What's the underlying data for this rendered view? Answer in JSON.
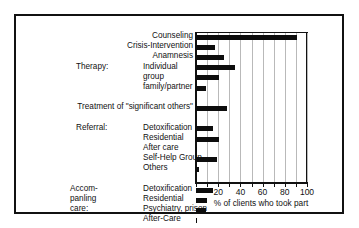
{
  "figure": {
    "frame_border_color": "#111111",
    "background": "#ffffff",
    "bar_color": "#0d0d0d",
    "grid_color": "#b9b9b9"
  },
  "chart_data": {
    "type": "bar",
    "orientation": "horizontal",
    "title": "",
    "xlabel": "% of clients who took part",
    "ylabel": "",
    "xlim": [
      0,
      100
    ],
    "grid": true,
    "legend": "none",
    "xticks": [
      0,
      10,
      20,
      30,
      40,
      50,
      60,
      70,
      80,
      90,
      100
    ],
    "xticklabels": [
      "",
      "",
      "20",
      "",
      "40",
      "",
      "60",
      "",
      "80",
      "",
      "100"
    ],
    "xticklabels_shown": [
      "20",
      "40",
      "60",
      "80",
      "100"
    ],
    "categories": [
      "Counseling",
      "Crisis-Intervention",
      "Anamnesis",
      "Therapy: Individual",
      "Therapy: group",
      "Therapy: family/partner",
      "Treatment of \"significant others\"",
      "Referral: Detoxification",
      "Referral: Residential",
      "Referral: After care",
      "Referral: Self-Help Group",
      "Referral: Others",
      "Accompanying care: Detoxification",
      "Accompanying care: Residential",
      "Accompanying care: Psychiatry, prison",
      "Accompanying care: After-Care"
    ],
    "values": [
      91,
      17,
      25,
      35,
      21,
      9,
      28,
      15,
      21,
      1,
      19,
      3,
      15,
      10,
      9,
      1
    ]
  },
  "label_rows": [
    {
      "id": "counseling",
      "text": "Counseling",
      "style": "right"
    },
    {
      "id": "crisis-intervention",
      "text": "Crisis-Intervention",
      "style": "right"
    },
    {
      "id": "anamnesis",
      "text": "Anamnesis",
      "style": "right"
    },
    {
      "id": "therapy-individual",
      "group": "Therapy:",
      "text": "Individual",
      "style": "group"
    },
    {
      "id": "therapy-group",
      "text": "group",
      "style": "sub"
    },
    {
      "id": "therapy-family",
      "text": "family/partner",
      "style": "sub"
    },
    {
      "id": "treatment-significant-others",
      "text": "Treatment of \"significant others\"",
      "style": "right"
    },
    {
      "id": "referral-detoxification",
      "group": "Referral:",
      "text": "Detoxification",
      "style": "group"
    },
    {
      "id": "referral-residential",
      "text": "Residential",
      "style": "sub"
    },
    {
      "id": "referral-after-care",
      "text": "After care",
      "style": "sub"
    },
    {
      "id": "referral-self-help",
      "text": "Self-Help Group",
      "style": "sub"
    },
    {
      "id": "referral-others",
      "text": "Others",
      "style": "sub"
    },
    {
      "id": "acc-detoxification",
      "group": "Accom-",
      "text": "Detoxification",
      "style": "group2"
    },
    {
      "id": "acc-residential",
      "group": "panling",
      "text": "Residential",
      "style": "group2"
    },
    {
      "id": "acc-psychiatry",
      "group": "care:",
      "text": "Psychiatry, prison",
      "style": "group2"
    },
    {
      "id": "acc-after-care",
      "text": "After-Care",
      "style": "sub"
    }
  ],
  "axis": {
    "xlabel": "% of clients who took part",
    "ticklabels": [
      "20",
      "40",
      "60",
      "80",
      "100"
    ]
  }
}
